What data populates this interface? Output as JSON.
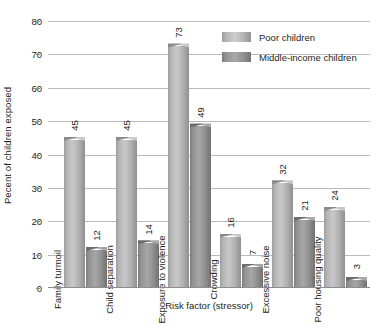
{
  "chart_data": {
    "type": "bar",
    "title": "",
    "xlabel": "Risk factor (stressor)",
    "ylabel": "Pecent of children exposed",
    "ylim": [
      0,
      80
    ],
    "ytick_step": 10,
    "yticks": [
      "0",
      "10",
      "20",
      "30",
      "40",
      "50",
      "60",
      "70",
      "80"
    ],
    "grid": true,
    "legend_position": "top-right",
    "categories": [
      "Family turmoil",
      "Child separation",
      "Exposure to violence",
      "Crowding",
      "Excessive noise",
      "Poor housing quality"
    ],
    "series": [
      {
        "name": "Poor children",
        "color": "#c0c0c0",
        "values": [
          45,
          45,
          73,
          16,
          32,
          24
        ],
        "labels": [
          "45",
          "45",
          "73",
          "16",
          "32",
          "24"
        ]
      },
      {
        "name": "Middle-income children",
        "color": "#9a9a9a",
        "values": [
          12,
          14,
          49,
          7,
          21,
          3
        ],
        "labels": [
          "12",
          "14",
          "49",
          "7",
          "21",
          "3"
        ]
      }
    ]
  },
  "legend": {
    "items": [
      {
        "label": "Poor children",
        "swatch": "poor"
      },
      {
        "label": "Middle-income children",
        "swatch": "middle"
      }
    ]
  },
  "colors": {
    "text": "#231f20",
    "gridline": "#b9b9b9",
    "axis": "#8d8d8d",
    "background": "#ffffff"
  }
}
